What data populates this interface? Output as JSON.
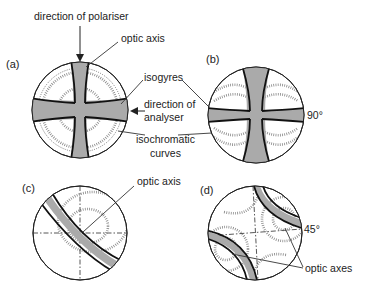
{
  "panels": {
    "a": {
      "label": "(a)"
    },
    "b": {
      "label": "(b)",
      "angle": "90°"
    },
    "c": {
      "label": "(c)"
    },
    "d": {
      "label": "(d)",
      "angle": "45°"
    }
  },
  "annotations": {
    "polariser": "direction of polariser",
    "optic_axis_a": "optic axis",
    "isogyres": "isogyres",
    "analyser_1": "direction of",
    "analyser_2": "analyser",
    "isochromatic_1": "isochromatic",
    "isochromatic_2": "curves",
    "optic_axis_c": "optic axis",
    "optic_axes_d": "optic axes"
  },
  "colors": {
    "isogyre_fill": "#aaaaaa",
    "outline": "#222222"
  }
}
